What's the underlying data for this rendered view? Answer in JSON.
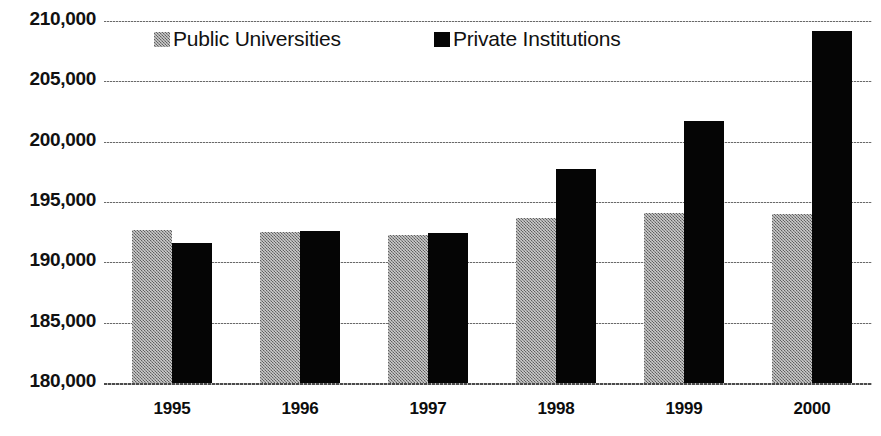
{
  "chart_data": {
    "type": "bar",
    "title": "",
    "subtitle": "",
    "xlabel": "",
    "ylabel": "",
    "categories": [
      "1995",
      "1996",
      "1997",
      "1998",
      "1999",
      "2000"
    ],
    "series": [
      {
        "name": "Public Universities",
        "color": "#8a8a8a",
        "pattern": "dither-gray",
        "values": [
          192700,
          192500,
          192300,
          193700,
          194100,
          194000
        ]
      },
      {
        "name": "Private Institutions",
        "color": "#050505",
        "pattern": "solid-black",
        "values": [
          191600,
          192600,
          192400,
          197700,
          201700,
          209200
        ]
      }
    ],
    "ylim": [
      180000,
      210000
    ],
    "ytick_step": 5000,
    "ytick_labels": [
      "210,000",
      "205,000",
      "200,000",
      "195,000",
      "190,000",
      "185,000",
      "180,000"
    ],
    "ytick_values": [
      210000,
      205000,
      200000,
      195000,
      190000,
      185000,
      180000
    ],
    "grid": true,
    "grid_style": "dotted-horizontal",
    "legend_position": "top-inside",
    "annotations": []
  },
  "legend": {
    "entries": [
      {
        "label": "Public Universities",
        "swatch": "public"
      },
      {
        "label": "Private Institutions",
        "swatch": "private"
      }
    ]
  },
  "header": {
    "cropped_title": ""
  }
}
